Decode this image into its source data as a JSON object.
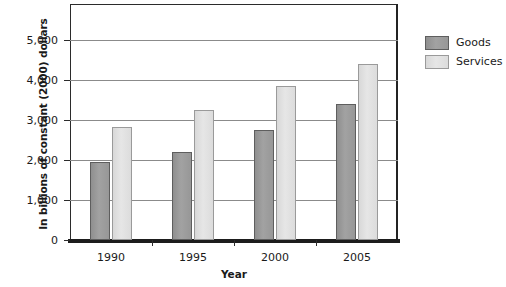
{
  "chart_data": {
    "type": "bar",
    "title": "",
    "subtitle": "",
    "xlabel": "Year",
    "ylabel": "In billions of constant (2000) dollars",
    "categories": [
      "1990",
      "1995",
      "2000",
      "2005"
    ],
    "series": [
      {
        "name": "Goods",
        "color": "#9a9a9a",
        "values": [
          1950,
          2200,
          2750,
          3400
        ]
      },
      {
        "name": "Services",
        "color": "#dcdcdc",
        "values": [
          2820,
          3250,
          3850,
          4400
        ]
      }
    ],
    "ylim": [
      0,
      5900
    ],
    "yticks": [
      0,
      1000,
      2000,
      3000,
      4000,
      5000
    ],
    "ytick_labels": [
      "0",
      "1,000",
      "2,000",
      "3,000",
      "4,000",
      "5,000"
    ],
    "grid": true,
    "grid_axis": "y",
    "legend_position": "right",
    "legend_entries": [
      "Goods",
      "Services"
    ]
  }
}
